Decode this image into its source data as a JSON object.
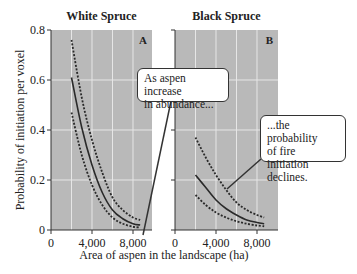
{
  "chart_data": [
    {
      "type": "line",
      "panel_label": "A",
      "title": "White Spruce",
      "xlabel": "Area of aspen in the landscape (ha)",
      "ylabel": "Probability of initiation per voxel",
      "xlim": [
        0,
        9850
      ],
      "ylim": [
        0,
        0.8
      ],
      "xticks": [
        "0",
        "4,000",
        "8,000"
      ],
      "yticks": [
        "0",
        "0.2",
        "0.4",
        "0.6",
        "0.8"
      ],
      "grid": true,
      "x": [
        2000,
        3000,
        4000,
        5000,
        6000,
        7000,
        8000,
        8700
      ],
      "series": [
        {
          "name": "Upper 95% bound",
          "style": "dashed",
          "values": [
            0.76,
            0.53,
            0.36,
            0.23,
            0.13,
            0.08,
            0.05,
            0.04
          ]
        },
        {
          "name": "Estimate",
          "style": "solid",
          "values": [
            0.61,
            0.41,
            0.26,
            0.15,
            0.08,
            0.045,
            0.025,
            0.02
          ]
        },
        {
          "name": "Lower 95% bound",
          "style": "dashed",
          "values": [
            0.47,
            0.3,
            0.18,
            0.1,
            0.05,
            0.025,
            0.013,
            0.01
          ]
        }
      ]
    },
    {
      "type": "line",
      "panel_label": "B",
      "title": "Black Spruce",
      "xlabel": "Area of aspen in the landscape (ha)",
      "ylabel": "Probability of initiation per voxel",
      "xlim": [
        0,
        9850
      ],
      "ylim": [
        0,
        0.8
      ],
      "xticks": [
        "0",
        "4,000",
        "8,000"
      ],
      "yticks": [
        "0",
        "0.2",
        "0.4",
        "0.6",
        "0.8"
      ],
      "grid": true,
      "x": [
        2000,
        3000,
        4000,
        5000,
        6000,
        7000,
        8000,
        8700
      ],
      "series": [
        {
          "name": "Upper 95% bound",
          "style": "dashed",
          "values": [
            0.37,
            0.29,
            0.22,
            0.16,
            0.11,
            0.08,
            0.06,
            0.05
          ]
        },
        {
          "name": "Estimate",
          "style": "solid",
          "values": [
            0.22,
            0.17,
            0.12,
            0.085,
            0.06,
            0.04,
            0.03,
            0.025
          ]
        },
        {
          "name": "Lower 95% bound",
          "style": "dashed",
          "values": [
            0.14,
            0.1,
            0.07,
            0.05,
            0.035,
            0.025,
            0.018,
            0.015
          ]
        }
      ]
    }
  ],
  "annotations": {
    "callout_1": "As aspen increase in abundance...",
    "callout_1_lines": [
      "As aspen increase",
      "in abundance..."
    ],
    "callout_2_lines": [
      "...the probability",
      "of fire initiation",
      "declines."
    ]
  },
  "colors": {
    "plot_background": "#b9b9b9",
    "gridline": "#e6e6e6",
    "line": "#2a2a2a"
  }
}
